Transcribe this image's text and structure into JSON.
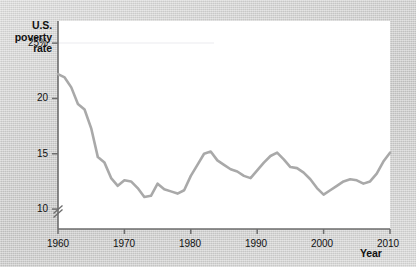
{
  "figure": {
    "background_color": "#d3d3d2",
    "plot_background_color": "#ffffff"
  },
  "axis_titles": {
    "y": "U.S. poverty rate",
    "x": "Year"
  },
  "y_tick_labels": [
    "25%",
    "20",
    "15",
    "10"
  ],
  "x_tick_labels": [
    "1960",
    "1970",
    "1980",
    "1990",
    "2000",
    "2010"
  ],
  "chart_data": {
    "type": "line",
    "title": "",
    "subtitle": "",
    "xlabel": "Year",
    "ylabel": "U.S. poverty rate",
    "xlim": [
      1960,
      2010
    ],
    "ylim": [
      8.2,
      27.0
    ],
    "y_axis_break": true,
    "y_axis_break_note": "axis broken below 10, baseline is not zero",
    "grid": false,
    "legend": false,
    "legend_position": "none",
    "x_ticks": [
      1960,
      1970,
      1980,
      1990,
      2000,
      2010
    ],
    "y_ticks": [
      10,
      15,
      20,
      25
    ],
    "y_tick_labels": [
      "10",
      "15",
      "20",
      "25%"
    ],
    "units": "percent",
    "line_color": "#a9a9a9",
    "line_width": 2.6,
    "series": [
      {
        "name": "U.S. poverty rate",
        "x": [
          1960,
          1961,
          1962,
          1963,
          1964,
          1965,
          1966,
          1967,
          1968,
          1969,
          1970,
          1971,
          1972,
          1973,
          1974,
          1975,
          1976,
          1977,
          1978,
          1979,
          1980,
          1981,
          1982,
          1983,
          1984,
          1985,
          1986,
          1987,
          1988,
          1989,
          1990,
          1991,
          1992,
          1993,
          1994,
          1995,
          1996,
          1997,
          1998,
          1999,
          2000,
          2001,
          2002,
          2003,
          2004,
          2005,
          2006,
          2007,
          2008,
          2009,
          2010
        ],
        "values": [
          22.2,
          21.9,
          21.0,
          19.5,
          19.0,
          17.3,
          14.7,
          14.2,
          12.8,
          12.1,
          12.6,
          12.5,
          11.9,
          11.1,
          11.2,
          12.3,
          11.8,
          11.6,
          11.4,
          11.7,
          13.0,
          14.0,
          15.0,
          15.2,
          14.4,
          14.0,
          13.6,
          13.4,
          13.0,
          12.8,
          13.5,
          14.2,
          14.8,
          15.1,
          14.5,
          13.8,
          13.7,
          13.3,
          12.7,
          11.9,
          11.3,
          11.7,
          12.1,
          12.5,
          12.7,
          12.6,
          12.3,
          12.5,
          13.2,
          14.3,
          15.1
        ]
      }
    ]
  }
}
